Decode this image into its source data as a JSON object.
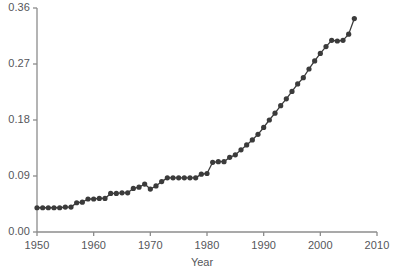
{
  "chart_data": {
    "type": "line",
    "title": "",
    "subtitle": "",
    "xlabel": "Year",
    "ylabel": "",
    "xlim": [
      1950,
      2010
    ],
    "ylim": [
      0.0,
      0.36
    ],
    "xticks": [
      1950,
      1960,
      1970,
      1980,
      1990,
      2000,
      2010
    ],
    "xtick_labels": [
      "1950",
      "1960",
      "1970",
      "1980",
      "1990",
      "2000",
      "2010"
    ],
    "yticks": [
      0.0,
      0.09,
      0.18,
      0.27,
      0.36
    ],
    "ytick_labels": [
      "0.00",
      "0.09",
      "0.18",
      "0.27",
      "0.36"
    ],
    "grid": false,
    "legend": false,
    "legend_position": "none",
    "marker": "filled-circle",
    "marker_color": "#3b3b3b",
    "line_color": "#3b3b3b",
    "axis_color": "#8c8c8c",
    "series": [
      {
        "name": "value",
        "x": [
          1950,
          1951,
          1952,
          1953,
          1954,
          1955,
          1956,
          1957,
          1958,
          1959,
          1960,
          1961,
          1962,
          1963,
          1964,
          1965,
          1966,
          1967,
          1968,
          1969,
          1970,
          1971,
          1972,
          1973,
          1974,
          1975,
          1976,
          1977,
          1978,
          1979,
          1980,
          1981,
          1982,
          1983,
          1984,
          1985,
          1986,
          1987,
          1988,
          1989,
          1990,
          1991,
          1992,
          1993,
          1994,
          1995,
          1996,
          1997,
          1998,
          1999,
          2000,
          2001,
          2002,
          2003,
          2004,
          2005,
          2006
        ],
        "values": [
          0.039,
          0.039,
          0.039,
          0.039,
          0.039,
          0.04,
          0.04,
          0.047,
          0.048,
          0.053,
          0.053,
          0.054,
          0.054,
          0.062,
          0.062,
          0.063,
          0.063,
          0.07,
          0.072,
          0.077,
          0.069,
          0.074,
          0.081,
          0.087,
          0.087,
          0.087,
          0.087,
          0.087,
          0.087,
          0.093,
          0.094,
          0.112,
          0.113,
          0.113,
          0.12,
          0.124,
          0.132,
          0.14,
          0.148,
          0.157,
          0.168,
          0.18,
          0.191,
          0.203,
          0.214,
          0.226,
          0.238,
          0.248,
          0.262,
          0.275,
          0.287,
          0.298,
          0.308,
          0.307,
          0.308,
          0.318,
          0.343
        ]
      }
    ]
  }
}
